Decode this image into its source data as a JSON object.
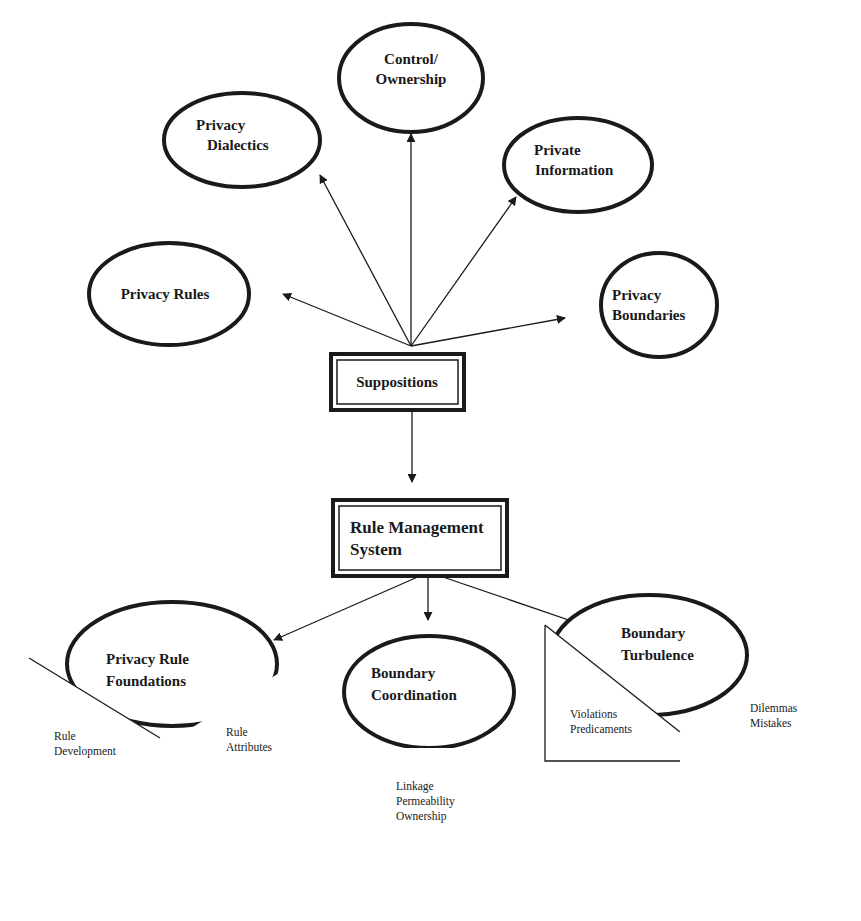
{
  "diagram": {
    "top_concepts": {
      "control_ownership": [
        "Control/",
        "Ownership"
      ],
      "privacy_dialectics": [
        "Privacy",
        "Dialectics"
      ],
      "private_information": [
        "Private",
        "Information"
      ],
      "privacy_rules": [
        "Privacy Rules"
      ],
      "privacy_boundaries": [
        "Privacy",
        "Boundaries"
      ]
    },
    "suppositions": "Suppositions",
    "rule_management_system": [
      "Rule Management",
      "System"
    ],
    "privacy_rule_foundations": {
      "title": [
        "Privacy Rule",
        "Foundations"
      ],
      "left_panel": [
        "Rule",
        "Development"
      ],
      "right_panel": [
        "Rule",
        "Attributes"
      ]
    },
    "boundary_coordination": {
      "title": [
        "Boundary",
        "Coordination"
      ],
      "panel": [
        "Linkage",
        "Permeability",
        "Ownership"
      ]
    },
    "boundary_turbulence": {
      "title": [
        "Boundary",
        "Turbulence"
      ],
      "left_panel": [
        "Violations",
        "Predicaments"
      ],
      "right_panel": [
        "Dilemmas",
        "Mistakes"
      ]
    },
    "colors": {
      "ink": "#1a1a1a",
      "background": "#ffffff"
    }
  }
}
